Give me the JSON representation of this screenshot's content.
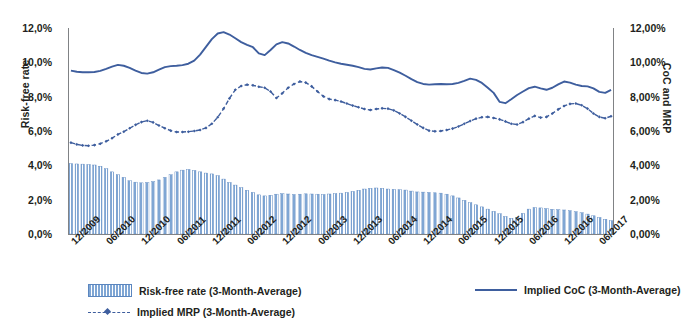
{
  "chart_data": {
    "type": "bar",
    "title": "",
    "xlabel": "",
    "ylabel": "Risk-free rate",
    "y2label": "CoC and MRP",
    "ylim": [
      0,
      12
    ],
    "y2lim": [
      0,
      12
    ],
    "grid": false,
    "legend_position": "bottom",
    "y_tick_labels": [
      "12,0%",
      "10,0%",
      "8,0%",
      "6,0%",
      "4,0%",
      "2,0%",
      "0,0%"
    ],
    "y_tick_values": [
      12,
      10,
      8,
      6,
      4,
      2,
      0
    ],
    "y2_tick_labels": [
      "12,00%",
      "10,00%",
      "8,00%",
      "6,00%",
      "4,00%",
      "2,00%",
      "0,00%"
    ],
    "y2_tick_values": [
      12,
      10,
      8,
      6,
      4,
      2,
      0
    ],
    "x_tick_labels": [
      "12/2009",
      "06/2010",
      "12/2010",
      "06/2011",
      "12/2011",
      "06/2012",
      "12/2012",
      "06/2013",
      "12/2013",
      "06/2014",
      "12/2014",
      "06/2015",
      "12/2015",
      "06/2016",
      "12/2016",
      "06/2017"
    ],
    "x_tick_indices": [
      0,
      6,
      12,
      18,
      24,
      30,
      36,
      42,
      48,
      54,
      60,
      66,
      72,
      78,
      84,
      90
    ],
    "n_points": 93,
    "colors": {
      "bar": "#7FA6D4",
      "bar_edge": "#5B86BF",
      "line_coc": "#3E5E9E",
      "line_mrp": "#3E5E9E",
      "axis": "#808285"
    },
    "series": [
      {
        "name": "Risk-free rate (3-Month-Average)",
        "style": "bar",
        "axis": "left",
        "values": [
          4.1,
          4.08,
          4.07,
          4.05,
          4.02,
          3.95,
          3.8,
          3.62,
          3.45,
          3.3,
          3.1,
          3.02,
          2.98,
          3.0,
          3.05,
          3.15,
          3.3,
          3.45,
          3.62,
          3.72,
          3.76,
          3.7,
          3.62,
          3.55,
          3.5,
          3.4,
          3.2,
          3.0,
          2.85,
          2.7,
          2.55,
          2.42,
          2.28,
          2.22,
          2.26,
          2.32,
          2.35,
          2.33,
          2.3,
          2.32,
          2.34,
          2.33,
          2.32,
          2.3,
          2.33,
          2.35,
          2.38,
          2.42,
          2.48,
          2.55,
          2.62,
          2.66,
          2.68,
          2.66,
          2.62,
          2.6,
          2.58,
          2.56,
          2.5,
          2.45,
          2.44,
          2.42,
          2.4,
          2.38,
          2.32,
          2.22,
          2.1,
          1.96,
          1.82,
          1.7,
          1.58,
          1.45,
          1.32,
          1.18,
          1.02,
          0.92,
          0.96,
          1.2,
          1.45,
          1.54,
          1.52,
          1.48,
          1.44,
          1.42,
          1.4,
          1.36,
          1.3,
          1.24,
          1.16,
          1.06,
          0.96,
          0.86,
          0.78
        ]
      },
      {
        "name": "Implied CoC (3-Month-Average)",
        "style": "solid-line",
        "axis": "right",
        "values": [
          9.52,
          9.45,
          9.42,
          9.42,
          9.44,
          9.5,
          9.62,
          9.75,
          9.85,
          9.8,
          9.68,
          9.52,
          9.38,
          9.34,
          9.42,
          9.58,
          9.72,
          9.78,
          9.8,
          9.84,
          9.92,
          10.1,
          10.45,
          10.9,
          11.35,
          11.68,
          11.76,
          11.62,
          11.4,
          11.18,
          11.02,
          10.88,
          10.52,
          10.42,
          10.72,
          11.05,
          11.18,
          11.1,
          10.92,
          10.72,
          10.55,
          10.42,
          10.32,
          10.22,
          10.1,
          10.0,
          9.92,
          9.86,
          9.8,
          9.72,
          9.62,
          9.58,
          9.65,
          9.7,
          9.68,
          9.55,
          9.4,
          9.22,
          9.02,
          8.85,
          8.74,
          8.7,
          8.72,
          8.74,
          8.72,
          8.74,
          8.8,
          8.92,
          9.05,
          8.98,
          8.8,
          8.52,
          8.22,
          7.7,
          7.62,
          7.85,
          8.1,
          8.3,
          8.5,
          8.58,
          8.48,
          8.4,
          8.52,
          8.72,
          8.88,
          8.82,
          8.7,
          8.62,
          8.6,
          8.48,
          8.28,
          8.22,
          8.4
        ]
      },
      {
        "name": "Implied MRP (3-Month-Average)",
        "style": "dashed-line-marker",
        "axis": "right",
        "values": [
          5.32,
          5.22,
          5.16,
          5.14,
          5.18,
          5.26,
          5.4,
          5.58,
          5.8,
          5.96,
          6.16,
          6.36,
          6.52,
          6.6,
          6.5,
          6.32,
          6.16,
          6.02,
          5.94,
          5.94,
          5.96,
          6.0,
          6.06,
          6.18,
          6.42,
          6.8,
          7.3,
          7.9,
          8.4,
          8.62,
          8.7,
          8.66,
          8.58,
          8.52,
          8.3,
          7.92,
          8.2,
          8.52,
          8.74,
          8.88,
          8.82,
          8.6,
          8.3,
          8.02,
          7.86,
          7.8,
          7.72,
          7.6,
          7.48,
          7.38,
          7.28,
          7.22,
          7.28,
          7.32,
          7.3,
          7.2,
          7.02,
          6.82,
          6.6,
          6.38,
          6.18,
          6.02,
          5.98,
          6.0,
          6.06,
          6.14,
          6.26,
          6.42,
          6.58,
          6.72,
          6.8,
          6.82,
          6.76,
          6.68,
          6.56,
          6.42,
          6.38,
          6.52,
          6.72,
          6.88,
          6.78,
          6.82,
          7.02,
          7.26,
          7.46,
          7.58,
          7.6,
          7.5,
          7.3,
          7.02,
          6.82,
          6.74,
          6.86
        ]
      }
    ]
  },
  "axes": {
    "left_title": "Risk-free rate",
    "right_title": "CoC and MRP"
  },
  "legend": {
    "items": [
      {
        "label": "Risk-free rate (3-Month-Average)",
        "marker": "bar-swatch"
      },
      {
        "label": "Implied CoC (3-Month-Average)",
        "marker": "solid-line-swatch"
      },
      {
        "label": "Implied MRP (3-Month-Average)",
        "marker": "dashed-line-swatch"
      }
    ]
  }
}
